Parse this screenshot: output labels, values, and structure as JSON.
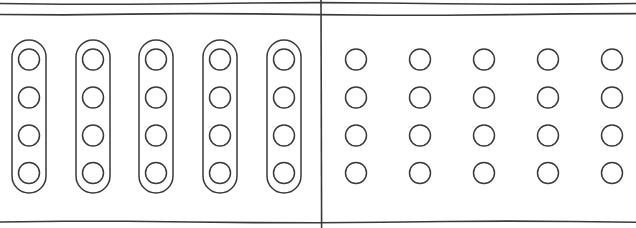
{
  "figure": {
    "width": 636,
    "height": 228,
    "background_color": "#ffffff",
    "stroke_color": "#3a3a3a",
    "fill_color": "#ffffff"
  },
  "rules": {
    "description": "Hand-drawn horizontal rule lines spanning the full width",
    "stroke_color": "#3a3a3a",
    "stroke_width": 1.6,
    "lines": [
      {
        "name": "top-rule-upper",
        "y": 3.5,
        "x_start": 0,
        "x_end": 636
      },
      {
        "name": "top-rule-lower",
        "y": 14.5,
        "x_start": 0,
        "x_end": 636
      },
      {
        "name": "bottom-rule",
        "y": 222.0,
        "x_start": 0,
        "x_end": 636
      }
    ]
  },
  "divider": {
    "name": "vertical-divider",
    "x": 321,
    "y_start": 0,
    "y_end": 228,
    "stroke_color": "#3a3a3a",
    "stroke_width": 1.6
  },
  "panels": [
    {
      "id": "left-panel",
      "label": "Grouped columns",
      "x_range": [
        0,
        321
      ],
      "group_count": 5,
      "nodes_per_group": 4,
      "group_shape": "rounded-capsule",
      "group_geometry": {
        "width": 34,
        "height": 153,
        "corner_radius": 17,
        "top_y": 40,
        "x_lefts": [
          12,
          76,
          139,
          203,
          267
        ]
      },
      "node_geometry": {
        "radius": 10.5,
        "row_centers_y": [
          59.5,
          97.5,
          135.5,
          173.0
        ],
        "column_centers_x": [
          29,
          93,
          156,
          220,
          284
        ]
      },
      "total_nodes": 20
    },
    {
      "id": "right-panel",
      "label": "Ungrouped grid",
      "x_range": [
        321,
        636
      ],
      "group_count": 0,
      "nodes_per_column": 4,
      "column_count": 5,
      "node_geometry": {
        "radius": 10.5,
        "row_centers_y": [
          59.5,
          97.5,
          135.5,
          173.0
        ],
        "column_centers_x": [
          356,
          420,
          484,
          548,
          612
        ]
      },
      "total_nodes": 20
    }
  ],
  "chart_data": {
    "type": "scatter",
    "xlabel": "",
    "ylabel": "",
    "grid": false,
    "legend": "none",
    "series": [
      {
        "name": "left-panel-grouped-nodes",
        "marker": "open-circle",
        "x": [
          29,
          29,
          29,
          29,
          93,
          93,
          93,
          93,
          156,
          156,
          156,
          156,
          220,
          220,
          220,
          220,
          284,
          284,
          284,
          284
        ],
        "y": [
          59.5,
          97.5,
          135.5,
          173.0,
          59.5,
          97.5,
          135.5,
          173.0,
          59.5,
          97.5,
          135.5,
          173.0,
          59.5,
          97.5,
          135.5,
          173.0,
          59.5,
          97.5,
          135.5,
          173.0
        ]
      },
      {
        "name": "right-panel-free-nodes",
        "marker": "open-circle",
        "x": [
          356,
          356,
          356,
          356,
          420,
          420,
          420,
          420,
          484,
          484,
          484,
          484,
          548,
          548,
          548,
          548,
          612,
          612,
          612,
          612
        ],
        "y": [
          59.5,
          97.5,
          135.5,
          173.0,
          59.5,
          97.5,
          135.5,
          173.0,
          59.5,
          97.5,
          135.5,
          173.0,
          59.5,
          97.5,
          135.5,
          173.0,
          59.5,
          97.5,
          135.5,
          173.0
        ]
      }
    ],
    "annotations": [
      {
        "name": "vertical-divider",
        "type": "vline",
        "x": 321
      },
      {
        "name": "top-rule-upper",
        "type": "hline",
        "y": 3.5
      },
      {
        "name": "top-rule-lower",
        "type": "hline",
        "y": 14.5
      },
      {
        "name": "bottom-rule",
        "type": "hline",
        "y": 222.0
      }
    ]
  }
}
